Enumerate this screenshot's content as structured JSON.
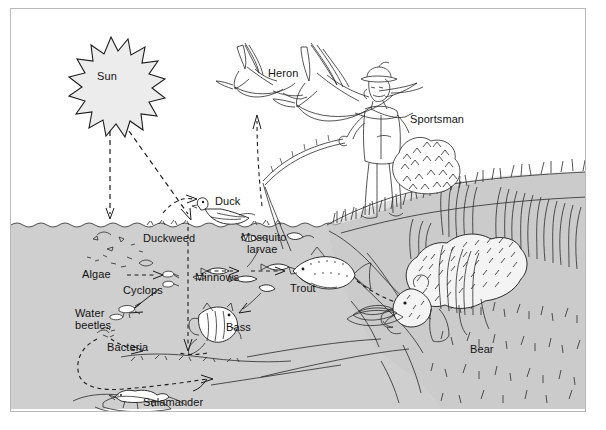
{
  "diagram": {
    "frame_border_color": "#b9b9b9",
    "water_color": "#cfcfcf",
    "background_color": "#ffffff",
    "ink_color": "#1a1a1a"
  },
  "labels": {
    "sun": "Sun",
    "heron": "Heron",
    "sportsman": "Sportsman",
    "duck": "Duck",
    "duckweed": "Duckweed",
    "mosquito_larvae_line1": "Mosquito",
    "mosquito_larvae_line2": "larvae",
    "algae": "Algae",
    "cyclops": "Cyclops",
    "minnows": "Minnows",
    "trout": "Trout",
    "water_line1": "Water",
    "water_line2": "beetles",
    "bacteria": "Bacteria",
    "bass": "Bass",
    "salamander": "Salamander",
    "bear": "Bear"
  },
  "organisms": [
    {
      "name": "Sun",
      "zone": "sky",
      "role": "energy source"
    },
    {
      "name": "Heron",
      "zone": "sky",
      "role": "predator"
    },
    {
      "name": "Sportsman",
      "zone": "bank",
      "role": "predator"
    },
    {
      "name": "Duck",
      "zone": "surface",
      "role": "consumer"
    },
    {
      "name": "Duckweed",
      "zone": "surface",
      "role": "producer"
    },
    {
      "name": "Mosquito larvae",
      "zone": "surface",
      "role": "consumer"
    },
    {
      "name": "Algae",
      "zone": "water",
      "role": "producer"
    },
    {
      "name": "Cyclops",
      "zone": "water",
      "role": "consumer"
    },
    {
      "name": "Minnows",
      "zone": "water",
      "role": "consumer"
    },
    {
      "name": "Trout",
      "zone": "water",
      "role": "predator"
    },
    {
      "name": "Water beetles",
      "zone": "water",
      "role": "consumer"
    },
    {
      "name": "Bacteria",
      "zone": "bottom",
      "role": "decomposer"
    },
    {
      "name": "Bass",
      "zone": "water",
      "role": "predator"
    },
    {
      "name": "Salamander",
      "zone": "bottom",
      "role": "consumer"
    },
    {
      "name": "Bear",
      "zone": "bank",
      "role": "predator"
    }
  ],
  "energy_flows": [
    {
      "from": "Sun",
      "to": "Algae"
    },
    {
      "from": "Sun",
      "to": "Duckweed"
    },
    {
      "from": "Algae",
      "to": "Cyclops"
    },
    {
      "from": "Cyclops",
      "to": "Minnows"
    },
    {
      "from": "Duckweed",
      "to": "Mosquito larvae"
    },
    {
      "from": "Mosquito larvae",
      "to": "Minnows"
    },
    {
      "from": "Minnows",
      "to": "Trout"
    },
    {
      "from": "Minnows",
      "to": "Bass"
    },
    {
      "from": "Duckweed",
      "to": "Duck"
    },
    {
      "from": "Duck",
      "to": "Heron"
    },
    {
      "from": "Trout",
      "to": "Sportsman"
    },
    {
      "from": "Trout",
      "to": "Bear"
    },
    {
      "from": "Bass",
      "to": "Bacteria"
    },
    {
      "from": "Bacteria",
      "to": "Salamander"
    },
    {
      "from": "Water beetles",
      "to": "Bacteria"
    },
    {
      "from": "Cyclops",
      "to": "Water beetles"
    }
  ]
}
